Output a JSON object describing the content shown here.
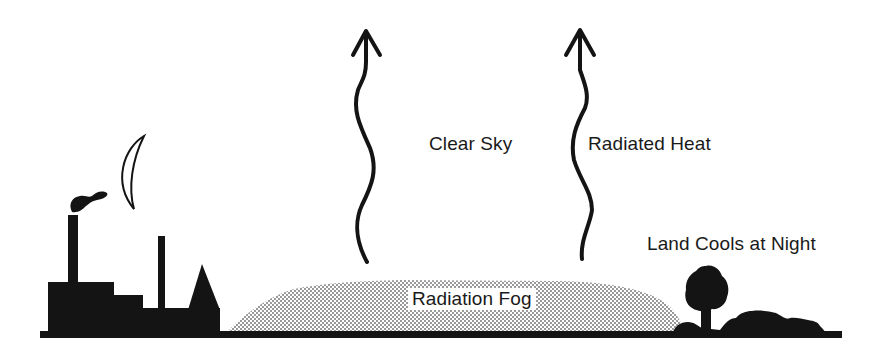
{
  "diagram": {
    "labels": {
      "clear_sky": "Clear Sky",
      "radiated_heat": "Radiated Heat",
      "land_cools": "Land Cools at Night",
      "radiation_fog": "Radiation Fog"
    },
    "elements": [
      {
        "name": "factory",
        "description": "factory silhouette with two chimneys and pointed roof"
      },
      {
        "name": "smoke",
        "description": "smoke puff above tall chimney"
      },
      {
        "name": "moon",
        "description": "crescent moon outline"
      },
      {
        "name": "heat-arrow-1",
        "description": "wavy upward arrow"
      },
      {
        "name": "heat-arrow-2",
        "description": "wavy upward arrow"
      },
      {
        "name": "fog-layer",
        "description": "stippled fog layer near ground"
      },
      {
        "name": "tree",
        "description": "tree silhouette"
      },
      {
        "name": "bushes",
        "description": "shrub silhouettes"
      },
      {
        "name": "ground",
        "description": "ground line"
      }
    ],
    "colors": {
      "ink": "#141414",
      "background": "#ffffff",
      "fog_dot": "#6a6a6a"
    }
  }
}
